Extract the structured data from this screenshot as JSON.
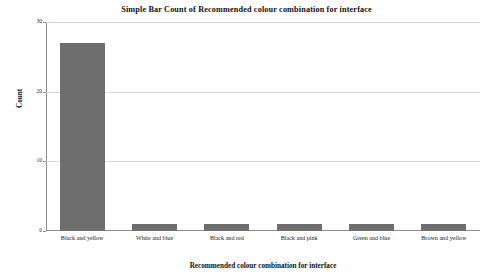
{
  "chart_data": {
    "type": "bar",
    "title": "Simple Bar Count of Recommended colour combination for interface",
    "xlabel": "Recommended colour combination for interface",
    "ylabel": "Count",
    "categories": [
      "Black and yellow",
      "White and blue",
      "Black and red",
      "Black and pink",
      "Green and blue",
      "Brown and yellow"
    ],
    "values": [
      27,
      1,
      1,
      1,
      1,
      1
    ],
    "ylim": [
      0,
      30
    ],
    "yticks": [
      0,
      10,
      20,
      30
    ],
    "ytick_labels": [
      "0",
      "10",
      "20",
      "30"
    ],
    "grid": true,
    "legend": false,
    "bar_color": "#6e6e6e",
    "grid_color": "#d8d8d8",
    "axis_color": "#8d8d8d",
    "background": "#ffffff"
  }
}
